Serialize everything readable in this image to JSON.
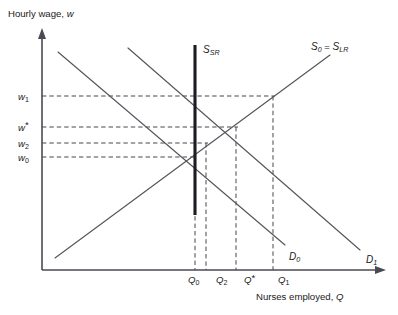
{
  "figure": {
    "y_axis_title": "Hourly wage, w",
    "y_axis_title_var": "w",
    "x_axis_title": "Nurses employed, Q",
    "x_axis_title_var": "Q"
  },
  "wage_labels": [
    {
      "id": "w1",
      "base": "w",
      "sub": "1",
      "text": "w1"
    },
    {
      "id": "wstar",
      "base": "w",
      "sub": "*",
      "text": "w*"
    },
    {
      "id": "w2",
      "base": "w",
      "sub": "2",
      "text": "w2"
    },
    {
      "id": "w0",
      "base": "w",
      "sub": "0",
      "text": "w0"
    }
  ],
  "quantity_labels": [
    {
      "id": "Q0",
      "base": "Q",
      "sub": "0",
      "text": "Q0"
    },
    {
      "id": "Q2",
      "base": "Q",
      "sub": "2",
      "text": "Q2"
    },
    {
      "id": "Qstar",
      "base": "Q",
      "sub": "*",
      "text": "Q*"
    },
    {
      "id": "Q1",
      "base": "Q",
      "sub": "1",
      "text": "Q1"
    }
  ],
  "curve_labels": {
    "supply_short_run": {
      "base": "S",
      "sub": "SR",
      "text": "S_SR"
    },
    "supply_long_run": {
      "base": "S",
      "sub": "0",
      "equals": " = ",
      "base2": "S",
      "sub2": "LR",
      "text": "S0 = SLR"
    },
    "demand_0": {
      "base": "D",
      "sub": "0",
      "text": "D0"
    },
    "demand_1": {
      "base": "D",
      "sub": "1",
      "text": "D1"
    }
  },
  "chart_data": {
    "type": "line",
    "title": "",
    "xlabel": "Nurses employed, Q",
    "ylabel": "Hourly wage, w",
    "grid": false,
    "legend": "inline curve labels",
    "xlim": [
      0,
      1
    ],
    "ylim": [
      0,
      1
    ],
    "series": [
      {
        "name": "S0 = SLR",
        "role": "long-run supply",
        "points": [
          [
            55,
            258
          ],
          [
            330,
            55
          ]
        ],
        "slope": "upward"
      },
      {
        "name": "S_SR",
        "role": "short-run supply",
        "points": [
          [
            195,
            45
          ],
          [
            195,
            215
          ]
        ],
        "slope": "vertical"
      },
      {
        "name": "D0",
        "role": "initial demand",
        "points": [
          [
            58,
            52
          ],
          [
            285,
            245
          ]
        ],
        "slope": "downward"
      },
      {
        "name": "D1",
        "role": "increased demand",
        "points": [
          [
            128,
            48
          ],
          [
            360,
            250
          ]
        ],
        "slope": "downward"
      }
    ],
    "equilibria": [
      {
        "name": "initial",
        "wage": "w0",
        "quantity": "Q0",
        "pixel": [
          195,
          157
        ]
      },
      {
        "name": "short-run",
        "wage": "w1",
        "quantity": "Q0",
        "pixel": [
          195,
          96
        ]
      },
      {
        "name": "long-run",
        "wage": "w*",
        "quantity": "Q*",
        "pixel": [
          236,
          127
        ]
      },
      {
        "name": "intermediate",
        "wage": "w2",
        "quantity": "Q2",
        "pixel": [
          206,
          143
        ]
      },
      {
        "name": "demand-at-w1",
        "wage": "w1",
        "quantity": "Q1",
        "pixel": [
          273,
          96
        ]
      }
    ],
    "wage_levels": {
      "w1": 96,
      "wstar": 127,
      "w2": 143,
      "w0": 157
    },
    "quantity_levels": {
      "Q0": 195,
      "Q2": 206,
      "Qstar": 236,
      "Q1": 273
    }
  }
}
